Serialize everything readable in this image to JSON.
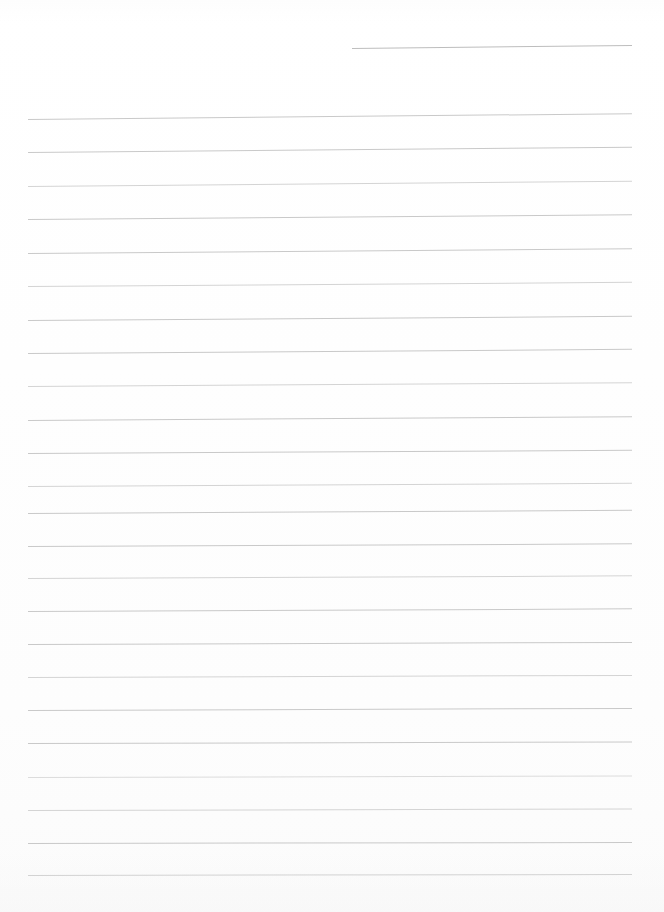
{
  "document": {
    "kind": "lined-writing-page",
    "title": "",
    "body_text": "",
    "page_width": 664,
    "page_height": 912,
    "background_color": "#ffffff",
    "rule_color": "#c9c9c9",
    "is_blank": true
  },
  "ruling": {
    "left_margin_x": 28,
    "right_margin_x": 632,
    "line_spacing": 33.4,
    "first_full_line_y": 119,
    "full_line_count": 23,
    "partial_top_line": {
      "start_x": 352,
      "end_x": 632,
      "y": 48,
      "tilt_degrees": -0.6
    },
    "full_lines": [
      {
        "y": 119,
        "tilt": -0.55,
        "shade": "normal"
      },
      {
        "y": 152,
        "tilt": -0.5,
        "shade": "normal"
      },
      {
        "y": 186,
        "tilt": -0.5,
        "shade": "faint"
      },
      {
        "y": 219,
        "tilt": -0.45,
        "shade": "normal"
      },
      {
        "y": 253,
        "tilt": -0.45,
        "shade": "normal"
      },
      {
        "y": 286,
        "tilt": -0.4,
        "shade": "faint"
      },
      {
        "y": 320,
        "tilt": -0.4,
        "shade": "normal"
      },
      {
        "y": 353,
        "tilt": -0.4,
        "shade": "normal"
      },
      {
        "y": 386,
        "tilt": -0.35,
        "shade": "faint"
      },
      {
        "y": 420,
        "tilt": -0.35,
        "shade": "normal"
      },
      {
        "y": 453,
        "tilt": -0.3,
        "shade": "normal"
      },
      {
        "y": 486,
        "tilt": -0.3,
        "shade": "faint"
      },
      {
        "y": 513,
        "tilt": -0.3,
        "shade": "normal"
      },
      {
        "y": 546,
        "tilt": -0.25,
        "shade": "normal"
      },
      {
        "y": 578,
        "tilt": -0.25,
        "shade": "faint"
      },
      {
        "y": 611,
        "tilt": -0.25,
        "shade": "normal"
      },
      {
        "y": 644,
        "tilt": -0.2,
        "shade": "normal"
      },
      {
        "y": 677,
        "tilt": -0.2,
        "shade": "faint"
      },
      {
        "y": 710,
        "tilt": -0.2,
        "shade": "normal"
      },
      {
        "y": 743,
        "tilt": -0.15,
        "shade": "normal"
      },
      {
        "y": 777,
        "tilt": -0.15,
        "shade": "faintest"
      },
      {
        "y": 810,
        "tilt": -0.15,
        "shade": "faint"
      },
      {
        "y": 843,
        "tilt": -0.1,
        "shade": "normal"
      },
      {
        "y": 875,
        "tilt": -0.1,
        "shade": "normal"
      }
    ]
  }
}
